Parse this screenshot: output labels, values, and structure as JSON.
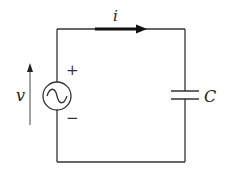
{
  "diagram": {
    "type": "circuit",
    "title": "",
    "components": [
      {
        "id": "source",
        "kind": "ac-voltage-source",
        "symbol": "~"
      },
      {
        "id": "capacitor",
        "kind": "capacitor",
        "label": "C"
      }
    ],
    "labels": {
      "current": "i",
      "voltage": "v",
      "capacitor": "C",
      "plus": "+",
      "minus": "−"
    },
    "colors": {
      "wire": "#333333",
      "arrow": "#111111",
      "text": "#222222",
      "background": "#ffffff"
    }
  }
}
